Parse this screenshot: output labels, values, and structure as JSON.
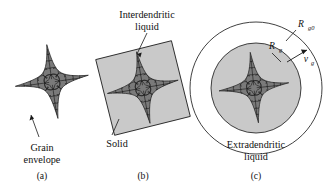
{
  "figure": {
    "panels": [
      {
        "id": "a",
        "caption": "(a)",
        "labels": [
          {
            "name": "grain-envelope-label",
            "line1": "Grain",
            "line2": "envelope"
          }
        ]
      },
      {
        "id": "b",
        "caption": "(b)",
        "labels": [
          {
            "name": "interdendritic-liquid-label",
            "line1": "Interdendritic",
            "line2": "liquid"
          },
          {
            "name": "solid-label",
            "line1": "Solid",
            "line2": ""
          }
        ]
      },
      {
        "id": "c",
        "caption": "(c)",
        "labels": [
          {
            "name": "extradendritic-liquid-label",
            "line1": "Extradendritic",
            "line2": "liquid"
          }
        ],
        "math_labels": [
          {
            "name": "outer-radius-label",
            "symbol": "R",
            "subscript": "g0"
          },
          {
            "name": "inner-radius-label",
            "symbol": "R",
            "subscript": "g"
          },
          {
            "name": "growth-velocity-label",
            "symbol": "v",
            "subscript": "g"
          }
        ]
      }
    ],
    "captions": {
      "a": "(a)",
      "b": "(b)",
      "c": "(c)"
    },
    "text": {
      "grain_line1": "Grain",
      "grain_line2": "envelope",
      "interdendritic_line1": "Interdendritic",
      "interdendritic_line2": "liquid",
      "solid": "Solid",
      "extradendritic_line1": "Extradendritic",
      "extradendritic_line2": "liquid",
      "R": "R",
      "sub_g0": "g0",
      "sub_g": "g",
      "v": "v"
    },
    "colors": {
      "background": "#ffffff",
      "grain_fill": "#7a7a7a",
      "liquid_fill": "#c9c9c9",
      "outline": "#2b2b2b",
      "text": "#111111"
    }
  }
}
